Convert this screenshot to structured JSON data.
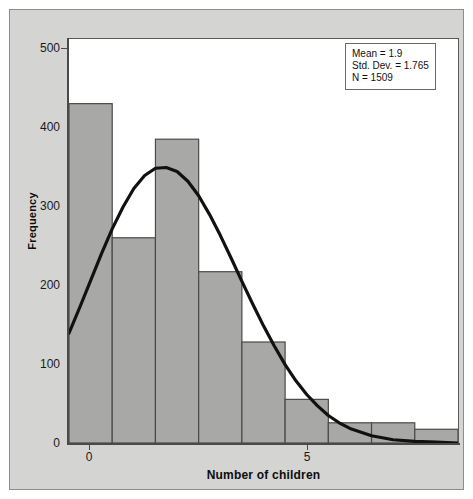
{
  "chart_data": {
    "type": "bar",
    "title": "",
    "subtitle": "",
    "xlabel": "Number of children",
    "ylabel": "Frequency",
    "categories": [
      "0",
      "1",
      "2",
      "3",
      "4",
      "5",
      "6",
      "7",
      "8"
    ],
    "values": [
      420,
      254,
      376,
      212,
      125,
      54,
      25,
      25,
      17
    ],
    "x": [
      0,
      1,
      2,
      3,
      4,
      5,
      6,
      7,
      8
    ],
    "xlim": [
      -0.5,
      8.5
    ],
    "ylim": [
      0,
      500
    ],
    "xticks": [
      0,
      5
    ],
    "xtick_labels": [
      "0",
      "5"
    ],
    "yticks": [
      0,
      100,
      200,
      300,
      400,
      500
    ],
    "ytick_labels": [
      "0",
      "100",
      "200",
      "300",
      "400",
      "500"
    ],
    "grid": false,
    "legend_position": "upper-right",
    "bar_color": "#a8a8a6",
    "bar_edge_color": "#4a4a48",
    "overlay": {
      "type": "line",
      "name": "normal-curve",
      "color": "#111111",
      "description": "Normal distribution curve fitted to the histogram",
      "points_x": [
        -0.5,
        -0.25,
        0.0,
        0.25,
        0.5,
        0.75,
        1.0,
        1.25,
        1.5,
        1.75,
        2.0,
        2.25,
        2.5,
        2.75,
        3.0,
        3.25,
        3.5,
        3.75,
        4.0,
        4.25,
        4.5,
        4.75,
        5.0,
        5.25,
        5.5,
        5.75,
        6.0,
        6.5,
        7.0,
        7.5,
        8.0,
        8.5
      ],
      "points_y": [
        136,
        168,
        201,
        234,
        265,
        292,
        315,
        331,
        340,
        341,
        336,
        324,
        306,
        283,
        257,
        229,
        200,
        172,
        145,
        120,
        97,
        77,
        60,
        46,
        34,
        25,
        18,
        9,
        4,
        2,
        1,
        0
      ]
    }
  },
  "stats_box": {
    "mean_line": "Mean = 1.9",
    "stddev_line": "Std. Dev. = 1.765",
    "n_line": "N = 1509"
  },
  "colors": {
    "panel_background": "#d4d4d2",
    "plot_background": "#ffffff",
    "bar_fill": "#a8a8a6",
    "axis": "#4a4a48",
    "text": "#111111"
  }
}
